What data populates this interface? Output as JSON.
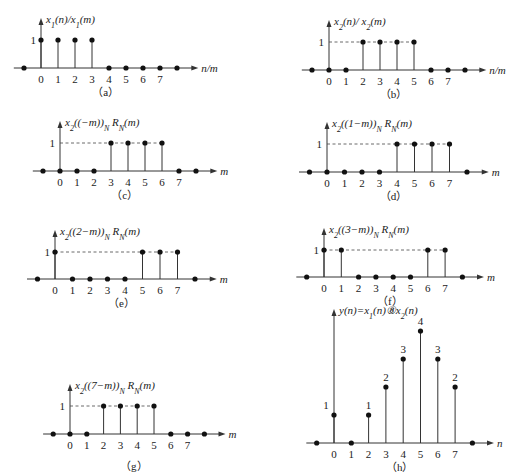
{
  "chart_data": [
    {
      "id": "a",
      "type": "stem",
      "caption": "（a）",
      "ylabel": "x1(n)/x1(m)",
      "xlabel": "n/m",
      "x": [
        -1,
        0,
        1,
        2,
        3,
        4,
        5,
        6,
        7,
        8
      ],
      "values": [
        0,
        1,
        1,
        1,
        1,
        0,
        0,
        0,
        0,
        0
      ],
      "tick_labels": [
        "0",
        "1",
        "2",
        "3",
        "4",
        "5",
        "6",
        "7"
      ],
      "y_tick": "1",
      "dashed": false,
      "geom": {
        "ox": 41,
        "oy": 68,
        "dx": 17,
        "unit": 28
      }
    },
    {
      "id": "b",
      "type": "stem",
      "caption": "（b）",
      "ylabel": "x2(n)/ x2(m)",
      "xlabel": "n/m",
      "x": [
        -1,
        0,
        1,
        2,
        3,
        4,
        5,
        6,
        7,
        8
      ],
      "values": [
        0,
        0,
        0,
        1,
        1,
        1,
        1,
        0,
        0,
        0
      ],
      "tick_labels": [
        "0",
        "1",
        "2",
        "3",
        "4",
        "5",
        "6",
        "7"
      ],
      "y_tick": "1",
      "dashed": true,
      "geom": {
        "ox": 329,
        "oy": 70,
        "dx": 17,
        "unit": 28
      }
    },
    {
      "id": "c",
      "type": "stem",
      "caption": "（c）",
      "ylabel": "x2((−m))N RN(m)",
      "xlabel": "m",
      "x": [
        -1,
        0,
        1,
        2,
        3,
        4,
        5,
        6,
        7,
        8
      ],
      "values": [
        0,
        0,
        0,
        0,
        1,
        1,
        1,
        1,
        0,
        0
      ],
      "tick_labels": [
        "0",
        "1",
        "2",
        "3",
        "4",
        "5",
        "6",
        "7"
      ],
      "y_tick": "1",
      "dashed": true,
      "geom": {
        "ox": 60,
        "oy": 171,
        "dx": 17,
        "unit": 28
      }
    },
    {
      "id": "d",
      "type": "stem",
      "caption": "（d）",
      "ylabel": "x2((1−m))N RN(m)",
      "xlabel": "m",
      "x": [
        -1,
        0,
        1,
        2,
        3,
        4,
        5,
        6,
        7,
        8
      ],
      "values": [
        0,
        0,
        0,
        0,
        0,
        1,
        1,
        1,
        1,
        0
      ],
      "tick_labels": [
        "0",
        "1",
        "2",
        "3",
        "4",
        "5",
        "6",
        "7"
      ],
      "y_tick": "1",
      "dashed": true,
      "geom": {
        "ox": 327,
        "oy": 172,
        "dx": 17.5,
        "unit": 28
      }
    },
    {
      "id": "e",
      "type": "stem",
      "caption": "（e）",
      "ylabel": "x2((2−m))N RN(m)",
      "xlabel": "m",
      "x": [
        -1,
        0,
        1,
        2,
        3,
        4,
        5,
        6,
        7,
        8
      ],
      "values": [
        0,
        1,
        0,
        0,
        0,
        0,
        1,
        1,
        1,
        0
      ],
      "tick_labels": [
        "0",
        "1",
        "2",
        "3",
        "4",
        "5",
        "6",
        "7"
      ],
      "y_tick": "1",
      "dashed": true,
      "geom": {
        "ox": 55,
        "oy": 279,
        "dx": 17.5,
        "unit": 27
      }
    },
    {
      "id": "f",
      "type": "stem",
      "caption": "（f）",
      "ylabel": "x2((3−m))N RN(m)",
      "xlabel": "m",
      "x": [
        -1,
        0,
        1,
        2,
        3,
        4,
        5,
        6,
        7,
        8
      ],
      "values": [
        0,
        1,
        1,
        0,
        0,
        0,
        0,
        1,
        1,
        0
      ],
      "tick_labels": [
        "0",
        "1",
        "2",
        "3",
        "4",
        "5",
        "6",
        "7"
      ],
      "y_tick": "1",
      "dashed": true,
      "geom": {
        "ox": 324,
        "oy": 277,
        "dx": 17.3,
        "unit": 27
      }
    },
    {
      "id": "g",
      "type": "stem",
      "caption": "（g）",
      "ylabel": "x2((7−m))N RN(m)",
      "xlabel": "m",
      "x": [
        -1,
        0,
        1,
        2,
        3,
        4,
        5,
        6,
        7,
        8
      ],
      "values": [
        0,
        0,
        0,
        1,
        1,
        1,
        1,
        0,
        0,
        0
      ],
      "tick_labels": [
        "0",
        "1",
        "2",
        "3",
        "4",
        "5",
        "6",
        "7"
      ],
      "y_tick": "1",
      "dashed": true,
      "geom": {
        "ox": 70,
        "oy": 434,
        "dx": 16.8,
        "unit": 28
      }
    },
    {
      "id": "h",
      "type": "stem",
      "caption": "（h）",
      "ylabel": "y(n)=x1(n)⑧x2(n)",
      "xlabel": "n",
      "x": [
        -1,
        0,
        1,
        2,
        3,
        4,
        5,
        6,
        7,
        8
      ],
      "values": [
        0,
        1,
        0,
        1,
        2,
        3,
        4,
        3,
        2,
        0
      ],
      "value_labels": [
        "",
        "1",
        "",
        "1",
        "2",
        "3",
        "4",
        "3",
        "2",
        ""
      ],
      "tick_labels": [
        "0",
        "1",
        "2",
        "3",
        "4",
        "5",
        "6",
        "7"
      ],
      "y_tick": "",
      "dashed": false,
      "geom": {
        "ox": 334,
        "oy": 443,
        "dx": 17.3,
        "unit": 28
      }
    }
  ]
}
